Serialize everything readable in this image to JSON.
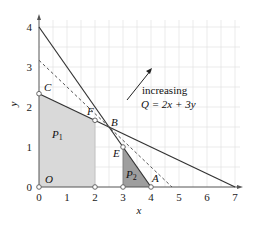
{
  "figure": {
    "axes": {
      "x_label": "x",
      "y_label": "y",
      "x_ticks": [
        "0",
        "1",
        "2",
        "3",
        "4",
        "5",
        "6",
        "7"
      ],
      "y_ticks": [
        "0",
        "1",
        "2",
        "3",
        "4"
      ]
    },
    "points": {
      "O": "O",
      "C": "C",
      "F": "F",
      "B": "B",
      "E": "E",
      "A": "A"
    },
    "regions": {
      "P1": "P",
      "P1_sub": "1",
      "P2": "P",
      "P2_sub": "2"
    },
    "annotation": {
      "line1": "increasing",
      "line2": "Q = 2x + 3y"
    },
    "colors": {
      "grid": "#e2e2e2",
      "axis": "#555555",
      "line": "#333333",
      "region_p1": "#d9d9d9",
      "region_p2": "#9e9e9e"
    }
  }
}
